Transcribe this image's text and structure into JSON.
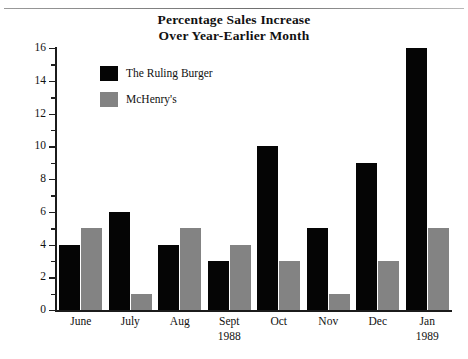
{
  "chart_data": {
    "type": "bar",
    "title": "Percentage Sales Increase Over Year-Earlier Month",
    "title_line1": "Percentage Sales Increase",
    "title_line2": "Over Year-Earlier Month",
    "xlabel": "",
    "ylabel": "",
    "ylim": [
      0,
      16
    ],
    "ytick_step": 2,
    "yminor_step": 1,
    "grid": false,
    "legend_position": "upper-left-inside",
    "categories": [
      "June",
      "July",
      "Aug",
      "Sept",
      "Oct",
      "Nov",
      "Dec",
      "Jan"
    ],
    "category_sublabels": [
      "",
      "",
      "",
      "1988",
      "",
      "",
      "",
      "1989"
    ],
    "ytick_labels": [
      "0",
      "2",
      "4",
      "6",
      "8",
      "10",
      "12",
      "14",
      "16"
    ],
    "series": [
      {
        "name": "The Ruling Burger",
        "color": "#050505",
        "values": [
          4,
          6,
          4,
          3,
          10,
          5,
          9,
          16
        ]
      },
      {
        "name": "McHenry's",
        "color": "#838383",
        "values": [
          5,
          1,
          5,
          4,
          3,
          1,
          3,
          5
        ]
      }
    ]
  }
}
